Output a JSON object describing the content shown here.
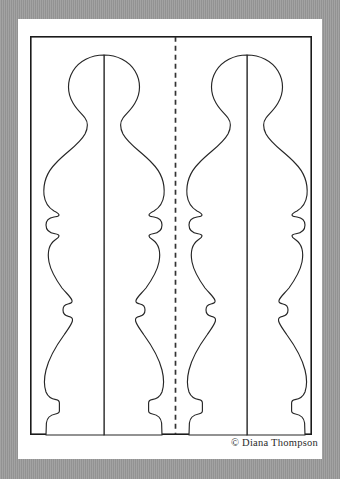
{
  "document": {
    "type": "woodworking-pattern-sheet",
    "title": "Finial / Baluster Turning Pattern",
    "description": "Two mirrored finial (baluster) profile outlines on a white pattern sheet, separated by a vertical dashed fold/center line, enclosed by a thin black rectangular border.",
    "background_color": "#9a9a9a",
    "page_color": "#ffffff",
    "line_color": "#222222"
  },
  "page": {
    "border": {
      "label": "pattern-border",
      "stroke_color": "#1b1b1b",
      "stroke_width": 1.6,
      "x": 30,
      "y": 36,
      "width": 282,
      "height": 399
    }
  },
  "fold_line": {
    "label": "center fold line",
    "style": "dashed",
    "x": 175.5,
    "y_top": 36,
    "y_bottom": 435,
    "dash": "5 4",
    "color": "#333333"
  },
  "shapes": [
    {
      "name": "finial-left",
      "label": "Left finial profile",
      "orientation": "upright",
      "mirrored": false,
      "center_x": 104,
      "top_y": 55,
      "bottom_y": 435
    },
    {
      "name": "finial-right",
      "label": "Right finial profile",
      "orientation": "upright",
      "mirrored": true,
      "center_x": 247,
      "top_y": 55,
      "bottom_y": 435
    }
  ],
  "profile": {
    "description": "Half-profile control points of the finial measured from the shape centerline (dx in px, y in px, absolute page coords for the left shape).",
    "features": [
      {
        "name": "ball-top",
        "y": 55
      },
      {
        "name": "ball-widest",
        "y": 85,
        "half_width": 36
      },
      {
        "name": "neck",
        "y": 118,
        "half_width": 14
      },
      {
        "name": "upper-bulge-widest",
        "y": 170,
        "half_width": 60
      },
      {
        "name": "cove-above-collar",
        "y": 206,
        "half_width": 45
      },
      {
        "name": "upper-collar-bead",
        "y": 218,
        "half_width": 57
      },
      {
        "name": "collar-under",
        "y": 233,
        "half_width": 46
      },
      {
        "name": "mid-taper",
        "y": 270,
        "half_width": 51
      },
      {
        "name": "mid-neck",
        "y": 296,
        "half_width": 31
      },
      {
        "name": "mid-bead",
        "y": 305,
        "half_width": 40
      },
      {
        "name": "lower-neck",
        "y": 318,
        "half_width": 30
      },
      {
        "name": "lower-bulge-widest",
        "y": 378,
        "half_width": 60
      },
      {
        "name": "step-shoulder",
        "y": 396,
        "half_width": 43
      },
      {
        "name": "plinth-step",
        "y": 412,
        "half_width": 45
      },
      {
        "name": "foot",
        "y": 435,
        "half_width": 58
      }
    ]
  },
  "credit": {
    "text": "© Diana Thompson",
    "symbol": "copyright-symbol",
    "author": "Diana Thompson"
  }
}
